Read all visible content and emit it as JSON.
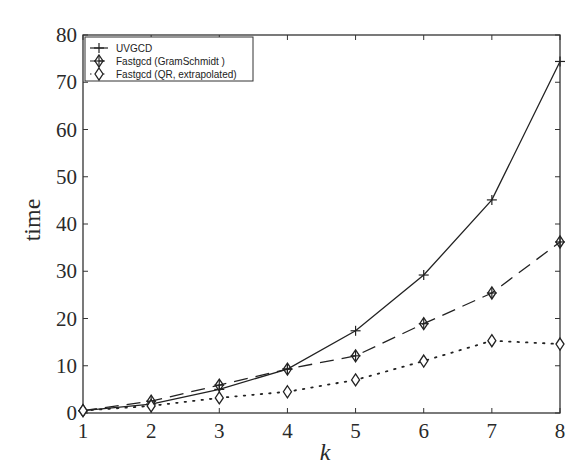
{
  "chart_data": {
    "type": "line",
    "title": "",
    "xlabel": "k",
    "ylabel": "time",
    "xlim": [
      1,
      8
    ],
    "ylim": [
      0,
      80
    ],
    "grid": false,
    "legend_position": "upper-left",
    "x": [
      1,
      2,
      3,
      4,
      5,
      6,
      7,
      8
    ],
    "xticks": [
      "1",
      "2",
      "3",
      "4",
      "5",
      "6",
      "7",
      "8"
    ],
    "yticks": [
      "0",
      "10",
      "20",
      "30",
      "40",
      "50",
      "60",
      "70",
      "80"
    ],
    "series": [
      {
        "name": "UVGCD",
        "style": "solid",
        "marker": "plus",
        "values": [
          0.5,
          1.9,
          5.0,
          9.3,
          17.4,
          29.2,
          45.1,
          74.4
        ]
      },
      {
        "name": "Fastgcd (GramSchmidt  )",
        "style": "dashed",
        "marker": "diamond-plus",
        "values": [
          0.5,
          2.5,
          5.9,
          9.3,
          12.1,
          18.9,
          25.4,
          36.2
        ]
      },
      {
        "name": "Fastgcd (QR, extrapolated)",
        "style": "dotted",
        "marker": "diamond",
        "values": [
          0.5,
          1.5,
          3.2,
          4.5,
          7.0,
          11.0,
          15.3,
          14.6
        ]
      }
    ]
  }
}
